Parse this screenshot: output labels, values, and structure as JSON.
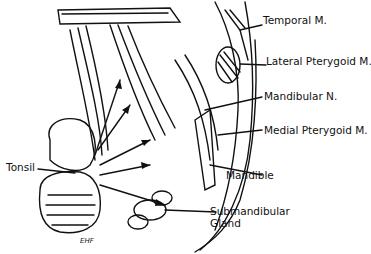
{
  "labels": {
    "temporal": "Temporal M.",
    "lateral_pterygoid": "Lateral Pterygoid M.",
    "mandibular_nerve": "Mandibular N.",
    "medial_pterygoid": "Medial Pterygoid M.",
    "tonsil": "Tonsil",
    "mandible": "Mandible",
    "submandibular_1": "Submandibular",
    "submandibular_2": "Gland"
  },
  "signature": "EHF"
}
